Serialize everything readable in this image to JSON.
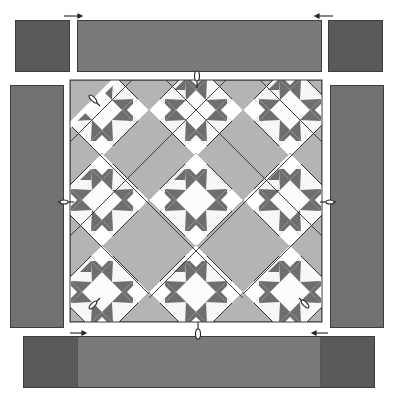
{
  "diagram": {
    "colors": {
      "background": "#ffffff",
      "border_dark": "#565656",
      "border_mid": "#797979",
      "setting_light": "#b4b4b4",
      "star_dark": "#6e6e6e",
      "star_light": "#f7f7f7",
      "outline": "#2e2e2e",
      "seam_line": "#ffffff"
    },
    "top_border": {
      "left_corner": {
        "x": 15,
        "y": 20,
        "w": 55,
        "h": 52
      },
      "strip": {
        "x": 77,
        "y": 20,
        "w": 245,
        "h": 52
      },
      "right_corner": {
        "x": 328,
        "y": 20,
        "w": 55,
        "h": 52
      },
      "arrows": [
        "arrow-right",
        "arrow-left"
      ]
    },
    "side_borders": {
      "left": {
        "x": 10,
        "y": 85,
        "w": 54,
        "h": 243
      },
      "right": {
        "x": 330,
        "y": 85,
        "w": 54,
        "h": 243
      },
      "arrows": [
        "arrow-left",
        "arrow-right"
      ]
    },
    "center": {
      "x": 70,
      "y": 80,
      "w": 252,
      "h": 242
    },
    "blocks": {
      "rows": 3,
      "cols": 3,
      "type": "star-on-point",
      "centers_x": [
        102,
        196,
        290
      ],
      "centers_y": [
        110,
        200,
        292
      ],
      "half_diag": 47
    },
    "bottom_border": {
      "left_corner": {
        "x": 23,
        "y": 336,
        "w": 54,
        "h": 52
      },
      "strip": {
        "x": 77,
        "y": 336,
        "w": 244,
        "h": 52
      },
      "right_corner": {
        "x": 321,
        "y": 336,
        "w": 54,
        "h": 52
      },
      "arrows": [
        "arrow-right",
        "arrow-left"
      ]
    }
  }
}
